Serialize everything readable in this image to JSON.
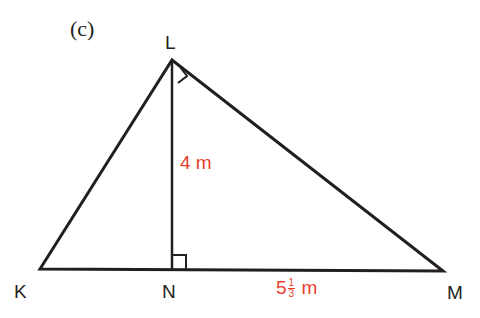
{
  "part_label": "(c)",
  "vertices": {
    "K": {
      "label": "K",
      "x": 40,
      "y": 269
    },
    "L": {
      "label": "L",
      "x": 172,
      "y": 60
    },
    "N": {
      "label": "N",
      "x": 172,
      "y": 269
    },
    "M": {
      "label": "M",
      "x": 443,
      "y": 271
    }
  },
  "measurements": {
    "LN": {
      "value": "4",
      "unit": "m"
    },
    "NM": {
      "whole": "5",
      "numerator": "1",
      "denominator": "3",
      "unit": "m"
    }
  },
  "right_angles": [
    "L",
    "N"
  ],
  "colors": {
    "line": "#231f20",
    "measurement": "#e8402a"
  }
}
